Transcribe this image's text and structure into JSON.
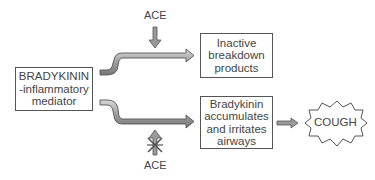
{
  "diagram": {
    "source_node": {
      "lines": [
        "BRADYKININ",
        "-inflammatory",
        "mediator"
      ]
    },
    "top_branch": {
      "enzyme_label": "ACE",
      "enzyme_action": "active (arrow pointing in)",
      "result_lines": [
        "Inactive",
        "breakdown",
        "products"
      ]
    },
    "bottom_branch": {
      "enzyme_label": "ACE",
      "enzyme_action": "inhibited (crossed-out arrow)",
      "result_lines": [
        "Bradykinin",
        "accumulates",
        "and irritates",
        "airways"
      ],
      "outcome": "COUGH"
    },
    "colors": {
      "arrow_fill": "#9a9a9a",
      "arrow_stroke": "#555555",
      "box_border": "#555555",
      "text": "#444444"
    }
  }
}
